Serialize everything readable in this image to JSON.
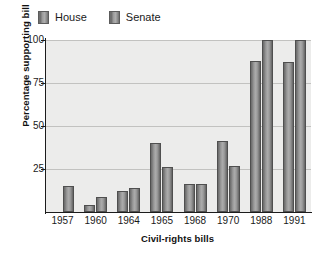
{
  "chart_data": {
    "type": "bar",
    "title": "",
    "xlabel": "Civil-rights bills",
    "ylabel": "Percentage supporting bill",
    "categories": [
      "1957",
      "1960",
      "1964",
      "1965",
      "1968",
      "1970",
      "1988",
      "1991"
    ],
    "series": [
      {
        "name": "House",
        "values": [
          0,
          4,
          12,
          40,
          16,
          41,
          88,
          87
        ]
      },
      {
        "name": "Senate",
        "values": [
          15,
          9,
          14,
          26,
          16,
          27,
          100,
          100
        ]
      }
    ],
    "ylim": [
      0,
      100
    ],
    "yticks": [
      25,
      50,
      75,
      100
    ],
    "ytick_labels": [
      "25",
      "50",
      "75",
      "100"
    ],
    "grid": true,
    "legend_position": "top-left",
    "colors": {
      "house": "#8f8f8f",
      "senate": "#9d9d9d",
      "plot_background": "#ececeb",
      "gridline": "#c2c2c0",
      "axis": "#1c1c1c",
      "text": "#1a1a1a",
      "page_background": "#ffffff"
    }
  },
  "legend": {
    "items": [
      {
        "label": "House"
      },
      {
        "label": "Senate"
      }
    ]
  }
}
